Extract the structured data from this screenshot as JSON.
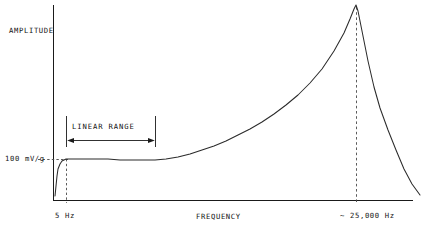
{
  "chart_data": {
    "type": "line",
    "title": "",
    "xlabel": "FREQUENCY",
    "ylabel": "AMPLITUDE",
    "grid": false,
    "legend": null,
    "axis_style": "open-corner (left spine and bottom spine only), no numeric ticks",
    "annotations": {
      "sensitivity": "100 mV/g",
      "low_frequency_limit": "5 Hz",
      "resonance_frequency": "~ 25,000 Hz",
      "linear_range": "LINEAR  RANGE"
    },
    "reference_lines": [
      {
        "name": "sensitivity-level",
        "orientation": "horizontal",
        "value": "100 mV/g",
        "style": "dashed"
      },
      {
        "name": "low-frequency-cutoff",
        "orientation": "vertical",
        "value": "5 Hz",
        "style": "dashed"
      },
      {
        "name": "resonance-peak",
        "orientation": "vertical",
        "value": "~ 25,000 Hz",
        "style": "dashed"
      }
    ],
    "series": [
      {
        "name": "frequency-response",
        "description": "Accelerometer amplitude response: steep low-frequency roll-on, flat linear plateau at 100 mV/g, gradual rise toward resonance, sharp peak then rapid roll-off.",
        "points": [
          [
            55,
            196
          ],
          [
            56,
            186
          ],
          [
            57,
            176
          ],
          [
            58,
            169
          ],
          [
            60,
            164
          ],
          [
            62,
            161
          ],
          [
            64,
            160
          ],
          [
            66,
            159
          ],
          [
            72,
            159
          ],
          [
            84,
            159
          ],
          [
            96,
            159
          ],
          [
            108,
            159
          ],
          [
            120,
            160
          ],
          [
            132,
            160
          ],
          [
            144,
            160
          ],
          [
            155,
            160
          ],
          [
            166,
            159
          ],
          [
            178,
            157
          ],
          [
            190,
            154
          ],
          [
            202,
            150
          ],
          [
            214,
            146
          ],
          [
            226,
            141
          ],
          [
            238,
            135
          ],
          [
            250,
            129
          ],
          [
            262,
            122
          ],
          [
            274,
            114
          ],
          [
            286,
            105
          ],
          [
            298,
            95
          ],
          [
            310,
            83
          ],
          [
            322,
            69
          ],
          [
            334,
            51
          ],
          [
            344,
            33
          ],
          [
            350,
            19
          ],
          [
            354,
            9
          ],
          [
            356,
            5
          ],
          [
            358,
            11
          ],
          [
            362,
            31
          ],
          [
            368,
            61
          ],
          [
            374,
            87
          ],
          [
            380,
            108
          ],
          [
            388,
            130
          ],
          [
            396,
            150
          ],
          [
            404,
            169
          ],
          [
            412,
            184
          ],
          [
            420,
            195
          ]
        ]
      }
    ]
  },
  "labels": {
    "amplitude": "AMPLITUDE",
    "frequency": "FREQUENCY",
    "sensitivity": "100 mV/g",
    "low_frequency": "5 Hz",
    "resonance": "~ 25,000 Hz",
    "linear_range": "LINEAR  RANGE"
  },
  "style": {
    "background": "#ffffff",
    "ink": "#1a1a1a",
    "curve_color": "#2b2b2b",
    "dash_color": "#4a4a4a"
  }
}
